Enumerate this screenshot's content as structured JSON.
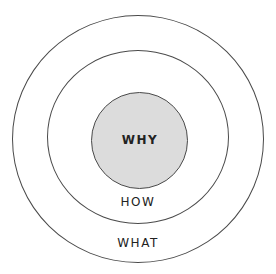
{
  "diagram": {
    "type": "concentric-circles",
    "layers": [
      {
        "id": "inner",
        "label": "WHY",
        "fill": "#dcdcdc"
      },
      {
        "id": "middle",
        "label": "HOW",
        "fill": "#ffffff"
      },
      {
        "id": "outer",
        "label": "WHAT",
        "fill": "#ffffff"
      }
    ],
    "stroke_color": "#4a4a4a"
  }
}
